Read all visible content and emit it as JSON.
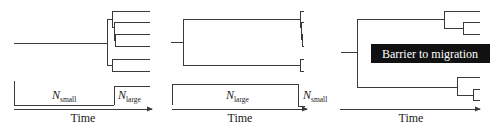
{
  "figure": {
    "panels": [
      {
        "id": "bottleneck-expansion",
        "population_labels": [
          {
            "main": "N",
            "sub": "small"
          },
          {
            "main": "N",
            "sub": "large"
          }
        ],
        "axis_label": "Time"
      },
      {
        "id": "recent-bottleneck",
        "population_labels": [
          {
            "main": "N",
            "sub": "large"
          },
          {
            "main": "N",
            "sub": "small"
          }
        ],
        "axis_label": "Time"
      },
      {
        "id": "population-structure",
        "barrier_label": "Barrier to migration",
        "axis_label": "Time"
      }
    ],
    "colors": {
      "line": "#3a3a3a",
      "barrier_fill": "#111111",
      "barrier_text": "#ffffff",
      "background": "#ffffff"
    }
  }
}
